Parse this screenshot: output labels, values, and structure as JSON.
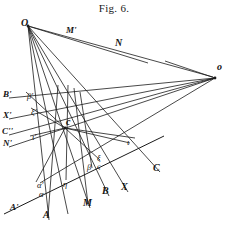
{
  "figure": {
    "title": "Fig. 6.",
    "caption_position": "top-center",
    "background_color": "#ffffff",
    "ink_color": "#1a1a1a",
    "width": 228,
    "height": 226
  },
  "points": [
    {
      "name": "O",
      "label": "O",
      "x": 28,
      "y": 26,
      "label_x": 21,
      "label_y": 18,
      "style": "roman"
    },
    {
      "name": "o",
      "label": "o",
      "x": 215,
      "y": 78,
      "label_x": 217,
      "label_y": 62,
      "style": "roman"
    },
    {
      "name": "c",
      "label": "c",
      "x": 65,
      "y": 128,
      "label_x": 66,
      "label_y": 117,
      "style": "roman"
    },
    {
      "name": "M-prime",
      "label": "M'",
      "x": 72,
      "y": 34,
      "label_x": 66,
      "label_y": 26,
      "style": "roman"
    },
    {
      "name": "N",
      "label": "N",
      "x": 120,
      "y": 46,
      "label_x": 115,
      "label_y": 38,
      "style": "roman"
    },
    {
      "name": "B-prime",
      "label": "B'",
      "x": 10,
      "y": 97,
      "label_x": 3,
      "label_y": 90,
      "style": "roman"
    },
    {
      "name": "X-prime",
      "label": "X'",
      "x": 10,
      "y": 118,
      "label_x": 3,
      "label_y": 111,
      "style": "roman"
    },
    {
      "name": "C-double-prime",
      "label": "C''",
      "x": 10,
      "y": 134,
      "label_x": 2,
      "label_y": 127,
      "style": "roman"
    },
    {
      "name": "N-prime",
      "label": "N'",
      "x": 10,
      "y": 146,
      "label_x": 3,
      "label_y": 139,
      "style": "roman"
    },
    {
      "name": "A-prime",
      "label": "A'",
      "x": 16,
      "y": 211,
      "label_x": 10,
      "label_y": 203,
      "style": "roman"
    },
    {
      "name": "A",
      "label": "A",
      "x": 48,
      "y": 218,
      "label_x": 43,
      "label_y": 210,
      "style": "roman"
    },
    {
      "name": "M",
      "label": "M",
      "x": 88,
      "y": 206,
      "label_x": 83,
      "label_y": 198,
      "style": "roman"
    },
    {
      "name": "B",
      "label": "B",
      "x": 107,
      "y": 194,
      "label_x": 102,
      "label_y": 186,
      "style": "roman"
    },
    {
      "name": "X",
      "label": "X",
      "x": 126,
      "y": 190,
      "label_x": 121,
      "label_y": 182,
      "style": "roman"
    },
    {
      "name": "C",
      "label": "C",
      "x": 158,
      "y": 171,
      "label_x": 153,
      "label_y": 163,
      "style": "roman"
    }
  ],
  "greek_labels": [
    {
      "name": "beta-prime",
      "label": "β′",
      "x": 27,
      "y": 92
    },
    {
      "name": "xi-prime",
      "label": "ξ′",
      "x": 31,
      "y": 108
    },
    {
      "name": "iota-prime",
      "label": "ι′",
      "x": 32,
      "y": 133
    },
    {
      "name": "alpha-prime",
      "label": "α′",
      "x": 37,
      "y": 181
    },
    {
      "name": "alpha",
      "label": "α",
      "x": 39,
      "y": 190
    },
    {
      "name": "eta",
      "label": "η",
      "x": 63,
      "y": 180
    },
    {
      "name": "beta",
      "label": "β",
      "x": 87,
      "y": 163
    },
    {
      "name": "xi",
      "label": "ξ",
      "x": 97,
      "y": 154
    },
    {
      "name": "sigma-final",
      "label": "ς",
      "x": 97,
      "y": 162
    },
    {
      "name": "iota",
      "label": "ι",
      "x": 127,
      "y": 138
    }
  ],
  "lines": {
    "pencil_from_O": [
      {
        "name": "O-to-M-prime-N-right",
        "x1": 28,
        "y1": 26,
        "x2": 213,
        "y2": 77
      },
      {
        "name": "O-to-C",
        "x1": 28,
        "y1": 26,
        "x2": 160,
        "y2": 172
      },
      {
        "name": "O-to-X",
        "x1": 28,
        "y1": 26,
        "x2": 128,
        "y2": 192
      },
      {
        "name": "O-to-B",
        "x1": 28,
        "y1": 26,
        "x2": 109,
        "y2": 196
      },
      {
        "name": "O-to-M",
        "x1": 28,
        "y1": 26,
        "x2": 90,
        "y2": 208
      },
      {
        "name": "O-to-eta",
        "x1": 28,
        "y1": 26,
        "x2": 68,
        "y2": 214
      },
      {
        "name": "O-to-A",
        "x1": 28,
        "y1": 26,
        "x2": 49,
        "y2": 220
      },
      {
        "name": "O-to-N-line",
        "x1": 28,
        "y1": 26,
        "x2": 148,
        "y2": 63
      }
    ],
    "pencil_from_o": [
      {
        "name": "o-to-B-prime",
        "x1": 215,
        "y1": 78,
        "x2": 9,
        "y2": 98
      },
      {
        "name": "o-to-X-prime",
        "x1": 215,
        "y1": 78,
        "x2": 9,
        "y2": 119
      },
      {
        "name": "o-to-C-double-prime",
        "x1": 215,
        "y1": 78,
        "x2": 9,
        "y2": 135
      },
      {
        "name": "o-to-N-prime",
        "x1": 215,
        "y1": 78,
        "x2": 9,
        "y2": 147
      },
      {
        "name": "o-to-iota",
        "x1": 215,
        "y1": 78,
        "x2": 40,
        "y2": 183
      },
      {
        "name": "o-to-upper-left-short",
        "x1": 215,
        "y1": 78,
        "x2": 165,
        "y2": 61
      }
    ],
    "pencil_from_c": [
      {
        "name": "c-to-beta-prime",
        "x1": 65,
        "y1": 128,
        "x2": 26,
        "y2": 92
      },
      {
        "name": "c-to-xi-prime",
        "x1": 65,
        "y1": 128,
        "x2": 31,
        "y2": 108
      },
      {
        "name": "c-to-iota-prime",
        "x1": 65,
        "y1": 128,
        "x2": 30,
        "y2": 136
      },
      {
        "name": "c-to-alpha-prime",
        "x1": 65,
        "y1": 128,
        "x2": 36,
        "y2": 182
      },
      {
        "name": "c-to-xi-sigma",
        "x1": 65,
        "y1": 128,
        "x2": 100,
        "y2": 160
      },
      {
        "name": "c-to-iota",
        "x1": 65,
        "y1": 128,
        "x2": 130,
        "y2": 143
      },
      {
        "name": "c-to-right-upper",
        "x1": 65,
        "y1": 128,
        "x2": 135,
        "y2": 138
      }
    ],
    "transversal": {
      "name": "transversal-A-prime-to-C",
      "x1": 4,
      "y1": 214,
      "x2": 164,
      "y2": 136
    },
    "verticals": [
      {
        "name": "vertical-through-alpha-to-A",
        "x1": 58,
        "y1": 85,
        "x2": 48,
        "y2": 216
      },
      {
        "name": "vertical-through-eta",
        "x1": 68,
        "y1": 85,
        "x2": 66,
        "y2": 180
      },
      {
        "name": "vertical-through-M",
        "x1": 74,
        "y1": 88,
        "x2": 88,
        "y2": 204
      },
      {
        "name": "vertical-through-beta",
        "x1": 80,
        "y1": 92,
        "x2": 92,
        "y2": 168
      }
    ]
  }
}
